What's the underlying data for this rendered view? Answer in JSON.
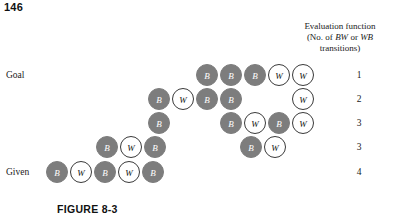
{
  "page_number": "146",
  "figure": {
    "caption": "FIGURE 8-3"
  },
  "header": {
    "line1": "Evaluation function",
    "line2_prefix": "(No. of ",
    "line2_italic1": "BW",
    "line2_mid": " or ",
    "line2_italic2": "WB",
    "line3": "transitions)"
  },
  "labels": {
    "goal": "Goal",
    "given": "Given"
  },
  "chart_data": {
    "type": "diagram",
    "title": "FIGURE 8-3",
    "token_legend": {
      "B": "black token",
      "W": "white token"
    },
    "colors": {
      "black_token_fill": "#7d7d7d",
      "black_token_text": "#ffffff",
      "white_token_fill": "#ffffff",
      "white_token_stroke": "#3a3a3a",
      "white_token_text": "#111111",
      "text": "#1a1a1a"
    },
    "grid": {
      "cell_width": 24,
      "row_height": 24,
      "token_size": 22
    },
    "rows": [
      {
        "row_label": "Goal",
        "eval_value": "1",
        "start_col": 0,
        "y": 64,
        "x0": 196,
        "cells": [
          "B",
          "B",
          "B",
          "W",
          "W"
        ]
      },
      {
        "row_label": "",
        "eval_value": "2",
        "start_col": 0,
        "y": 88,
        "x0": 148,
        "cells": [
          "B",
          "W",
          "B",
          "B",
          "",
          "",
          "W"
        ]
      },
      {
        "row_label": "",
        "eval_value": "3",
        "start_col": 0,
        "y": 112,
        "x0": 148,
        "cells": [
          "B",
          "",
          "",
          "B",
          "W",
          "B",
          "W"
        ]
      },
      {
        "row_label": "",
        "eval_value": "3",
        "start_col": 0,
        "y": 136,
        "x0": 96,
        "cells": [
          "B",
          "W",
          "B",
          "",
          "",
          "",
          "B",
          "W"
        ]
      },
      {
        "row_label": "Given",
        "eval_value": "4",
        "start_col": 0,
        "y": 161,
        "x0": 46,
        "cells": [
          "B",
          "W",
          "B",
          "W",
          "B"
        ]
      }
    ]
  }
}
